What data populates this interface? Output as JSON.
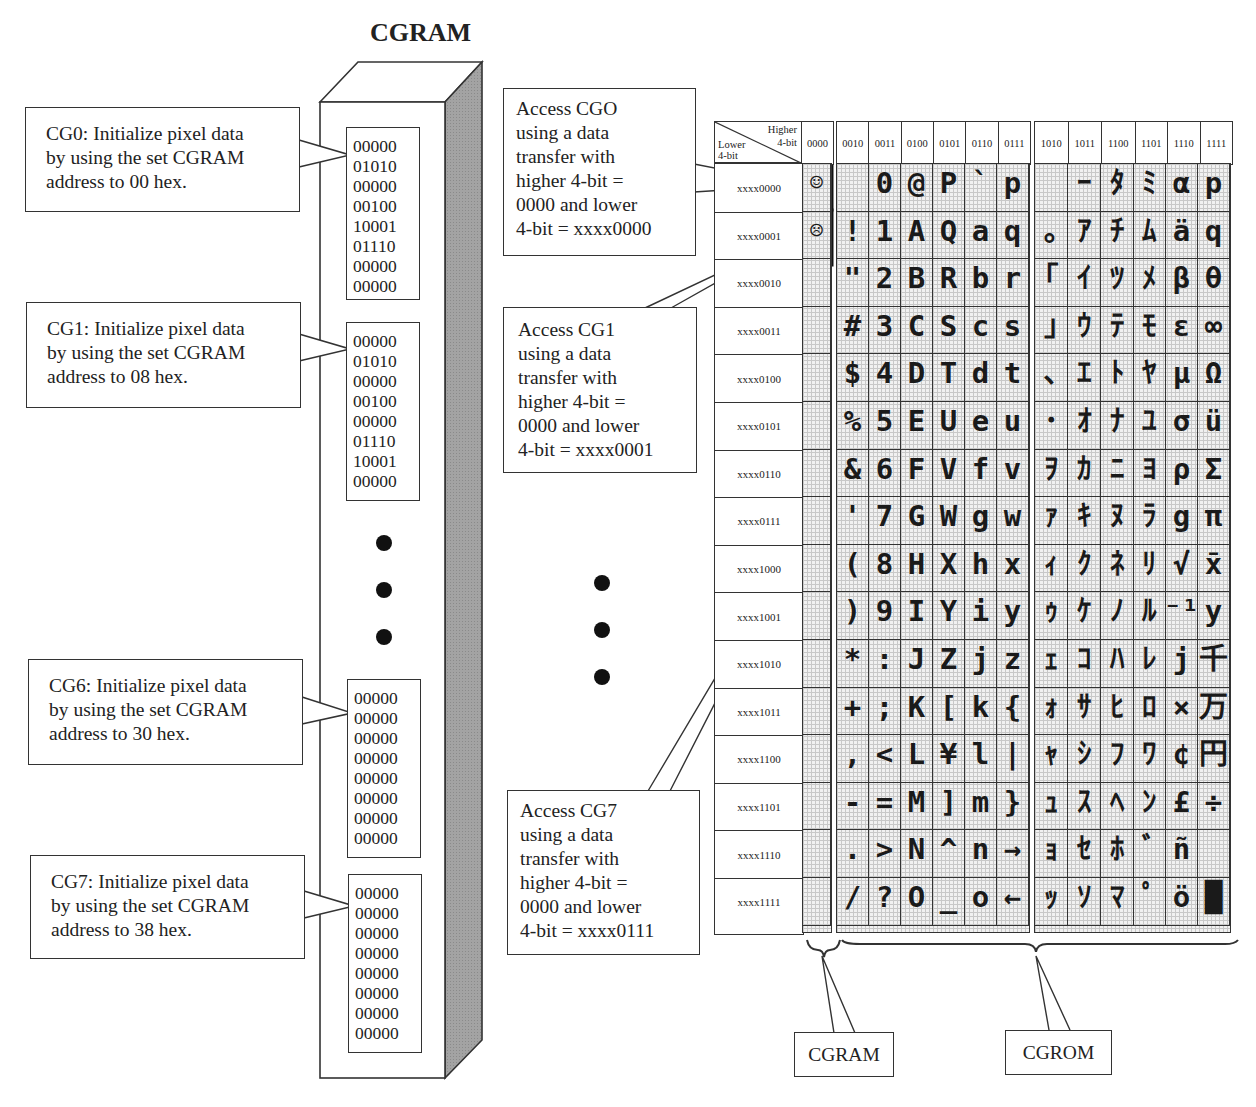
{
  "title": "CGRAM",
  "cgram_entries": [
    {
      "label": "CG0: Initialize pixel data by using the set CGRAM address to 00 hex.",
      "lines": [
        "CG0: Initialize pixel data",
        "by using the set CGRAM",
        "address to 00 hex."
      ],
      "bits": [
        "00000",
        "01010",
        "00000",
        "00100",
        "10001",
        "01110",
        "00000",
        "00000"
      ]
    },
    {
      "label": "CG1: Initialize pixel data by using the set CGRAM address to 08 hex.",
      "lines": [
        "CG1: Initialize pixel data",
        "by using the set CGRAM",
        "address to 08 hex."
      ],
      "bits": [
        "00000",
        "01010",
        "00000",
        "00100",
        "00000",
        "01110",
        "10001",
        "00000"
      ]
    },
    {
      "label": "CG6: Initialize pixel data by using the set CGRAM address to 30 hex.",
      "lines": [
        "CG6: Initialize pixel data",
        "by using the set CGRAM",
        "address to 30 hex."
      ],
      "bits": [
        "00000",
        "00000",
        "00000",
        "00000",
        "00000",
        "00000",
        "00000",
        "00000"
      ]
    },
    {
      "label": "CG7: Initialize pixel data by using the set CGRAM address to 38 hex.",
      "lines": [
        "CG7: Initialize pixel data",
        "by using the set CGRAM",
        "address to 38 hex."
      ],
      "bits": [
        "00000",
        "00000",
        "00000",
        "00000",
        "00000",
        "00000",
        "00000",
        "00000"
      ]
    }
  ],
  "access_callouts": [
    {
      "lines": [
        "Access CGO",
        "using a data",
        "transfer with",
        "higher 4-bit =",
        "0000 and lower",
        "4-bit = xxxx0000"
      ]
    },
    {
      "lines": [
        "Access CG1",
        "using a data",
        "transfer with",
        "higher 4-bit =",
        "0000 and lower",
        "4-bit = xxxx0001"
      ]
    },
    {
      "lines": [
        "Access CG7",
        "using a data",
        "transfer with",
        "higher 4-bit =",
        "0000 and lower",
        "4-bit = xxxx0111"
      ]
    }
  ],
  "table": {
    "corner": {
      "higher": "Higher",
      "higher2": "4-bit",
      "lower": "Lower",
      "lower2": "4-bit"
    },
    "col_headers": [
      "0000",
      "0010",
      "0011",
      "0100",
      "0101",
      "0110",
      "0111",
      "1010",
      "1011",
      "1100",
      "1101",
      "1110",
      "1111"
    ],
    "row_headers": [
      "xxxx0000",
      "xxxx0001",
      "xxxx0010",
      "xxxx0011",
      "xxxx0100",
      "xxxx0101",
      "xxxx0110",
      "xxxx0111",
      "xxxx1000",
      "xxxx1001",
      "xxxx1010",
      "xxxx1011",
      "xxxx1100",
      "xxxx1101",
      "xxxx1110",
      "xxxx1111"
    ],
    "cgram_column": [
      "☺",
      "☹",
      "",
      "",
      "",
      "",
      "",
      "",
      "",
      "",
      "",
      "",
      "",
      "",
      "",
      ""
    ],
    "cgrom_ascii_columns": [
      [
        " ",
        "0",
        "@",
        "P",
        "`",
        "p"
      ],
      [
        "!",
        "1",
        "A",
        "Q",
        "a",
        "q"
      ],
      [
        "\"",
        "2",
        "B",
        "R",
        "b",
        "r"
      ],
      [
        "#",
        "3",
        "C",
        "S",
        "c",
        "s"
      ],
      [
        "$",
        "4",
        "D",
        "T",
        "d",
        "t"
      ],
      [
        "%",
        "5",
        "E",
        "U",
        "e",
        "u"
      ],
      [
        "&",
        "6",
        "F",
        "V",
        "f",
        "v"
      ],
      [
        "'",
        "7",
        "G",
        "W",
        "g",
        "w"
      ],
      [
        "(",
        "8",
        "H",
        "X",
        "h",
        "x"
      ],
      [
        ")",
        "9",
        "I",
        "Y",
        "i",
        "y"
      ],
      [
        "*",
        ":",
        "J",
        "Z",
        "j",
        "z"
      ],
      [
        "+",
        ";",
        "K",
        "[",
        "k",
        "{"
      ],
      [
        ",",
        "<",
        "L",
        "¥",
        "l",
        "|"
      ],
      [
        "-",
        "=",
        "M",
        "]",
        "m",
        "}"
      ],
      [
        ".",
        ">",
        "N",
        "^",
        "n",
        "→"
      ],
      [
        "/",
        "?",
        "O",
        "_",
        "o",
        "←"
      ]
    ],
    "cgrom_kana_columns": [
      [
        " ",
        "ｰ",
        "ﾀ",
        "ﾐ",
        "α",
        "p"
      ],
      [
        "｡",
        "ｱ",
        "ﾁ",
        "ﾑ",
        "ä",
        "q"
      ],
      [
        "｢",
        "ｲ",
        "ﾂ",
        "ﾒ",
        "β",
        "θ"
      ],
      [
        "｣",
        "ｳ",
        "ﾃ",
        "ﾓ",
        "ε",
        "∞"
      ],
      [
        "､",
        "ｴ",
        "ﾄ",
        "ﾔ",
        "μ",
        "Ω"
      ],
      [
        "･",
        "ｵ",
        "ﾅ",
        "ﾕ",
        "σ",
        "ü"
      ],
      [
        "ｦ",
        "ｶ",
        "ﾆ",
        "ﾖ",
        "ρ",
        "Σ"
      ],
      [
        "ｧ",
        "ｷ",
        "ﾇ",
        "ﾗ",
        "g",
        "π"
      ],
      [
        "ｨ",
        "ｸ",
        "ﾈ",
        "ﾘ",
        "√",
        "x̄"
      ],
      [
        "ｩ",
        "ｹ",
        "ﾉ",
        "ﾙ",
        "⁻¹",
        "y"
      ],
      [
        "ｪ",
        "ｺ",
        "ﾊ",
        "ﾚ",
        "j",
        "千"
      ],
      [
        "ｫ",
        "ｻ",
        "ﾋ",
        "ﾛ",
        "×",
        "万"
      ],
      [
        "ｬ",
        "ｼ",
        "ﾌ",
        "ﾜ",
        "¢",
        "円"
      ],
      [
        "ｭ",
        "ｽ",
        "ﾍ",
        "ﾝ",
        "£",
        "÷"
      ],
      [
        "ｮ",
        "ｾ",
        "ﾎ",
        "ﾞ",
        "ñ",
        " "
      ],
      [
        "ｯ",
        "ｿ",
        "ﾏ",
        "ﾟ",
        "ö",
        "█"
      ]
    ]
  },
  "labels": {
    "cgram": "CGRAM",
    "cgrom": "CGROM"
  },
  "colors": {
    "line": "#333333",
    "shade": "#9a9a9a",
    "grid_bg": "#f1f1f1"
  }
}
